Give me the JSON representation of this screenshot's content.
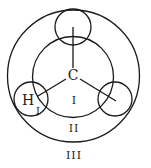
{
  "diagram": {
    "type": "molecular-projection",
    "colors": {
      "stroke": "#1a1a1a",
      "background": "#ffffff"
    },
    "atoms": {
      "center": {
        "label": "C"
      },
      "left": {
        "label": "H"
      }
    },
    "regions": {
      "inner": {
        "label": "I"
      },
      "left_atom_sub": {
        "label": "I"
      },
      "middle": {
        "label": "II"
      },
      "outer": {
        "label": "III"
      }
    }
  }
}
